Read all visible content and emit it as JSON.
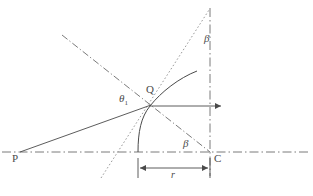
{
  "figure": {
    "type": "geometry-diagram",
    "width": 313,
    "height": 196,
    "background_color": "#ffffff",
    "stroke_color": "#4a4a4a",
    "labels": {
      "point_p": "P",
      "point_q": "Q",
      "point_c": "C",
      "angle_theta1_base": "θ",
      "angle_theta1_sub": "1",
      "angle_beta_upper": "β",
      "angle_beta_lower": "β",
      "radius": "r"
    },
    "geometry": {
      "points": {
        "P": {
          "x": 20,
          "y": 152
        },
        "Q": {
          "x": 150,
          "y": 106
        },
        "C": {
          "x": 210,
          "y": 152
        },
        "arc_foot": {
          "x": 138,
          "y": 152
        },
        "curve_end": {
          "x": 197,
          "y": 71
        }
      },
      "optical_axis": {
        "x1": 2,
        "y1": 152,
        "x2": 311,
        "y2": 152
      },
      "vertical_axis_at_C": {
        "x1": 210,
        "y1": 8,
        "x2": 210,
        "y2": 176
      },
      "normal_line": {
        "x1": 62,
        "y1": 35,
        "x2": 210,
        "y2": 152
      },
      "tangent_line": {
        "x1": 101,
        "y1": 178,
        "x2": 209,
        "y2": 10
      },
      "incident_ray": {
        "x1": 20,
        "y1": 152,
        "x2": 150,
        "y2": 106
      },
      "refracted_axis_ray": {
        "x1": 150,
        "y1": 106,
        "x2": 223,
        "y2": 106
      },
      "dimension_line": {
        "x1": 138,
        "y1": 168,
        "x2": 210,
        "y2": 168
      },
      "radius_value_label": "r"
    }
  }
}
